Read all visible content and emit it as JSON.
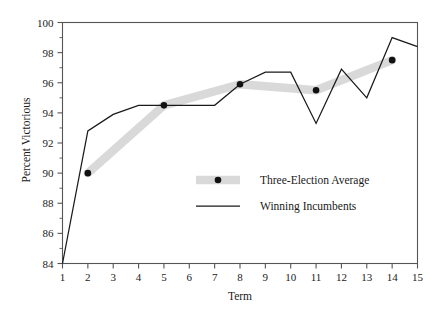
{
  "chart_data": {
    "type": "line",
    "title": "",
    "subtitle": "",
    "xlabel": "Term",
    "ylabel": "Percent Victorious",
    "xlim": [
      1,
      15
    ],
    "ylim": [
      84,
      100
    ],
    "xticks": [
      1,
      2,
      3,
      4,
      5,
      6,
      7,
      8,
      9,
      10,
      11,
      12,
      13,
      14,
      15
    ],
    "yticks": [
      84,
      86,
      88,
      90,
      92,
      94,
      96,
      98,
      100
    ],
    "xtick_labels": [
      "1",
      "2",
      "3",
      "4",
      "5",
      "6",
      "7",
      "8",
      "9",
      "10",
      "11",
      "12",
      "13",
      "14",
      "15"
    ],
    "ytick_labels": [
      "84",
      "86",
      "88",
      "90",
      "92",
      "94",
      "96",
      "98",
      "100"
    ],
    "grid": false,
    "legend_position": "center",
    "series": [
      {
        "name": "Three-Election Average",
        "style": "thick-band-with-markers",
        "color": "#d9d9d9",
        "marker_color": "#111111",
        "x": [
          2,
          5,
          8,
          11,
          14
        ],
        "values": [
          90.0,
          94.5,
          95.9,
          95.5,
          97.5
        ]
      },
      {
        "name": "Winning Incumbents",
        "style": "thin-line",
        "color": "#1a1a1a",
        "x": [
          1,
          2,
          3,
          4,
          5,
          6,
          7,
          8,
          9,
          10,
          11,
          12,
          13,
          14,
          15
        ],
        "values": [
          84.0,
          92.8,
          93.9,
          94.5,
          94.5,
          94.5,
          94.5,
          95.9,
          96.7,
          96.7,
          93.3,
          96.9,
          95.0,
          99.0,
          98.4
        ]
      }
    ]
  },
  "legend": {
    "items": [
      {
        "label": "Three-Election Average",
        "swatch": "band-marker"
      },
      {
        "label": "Winning Incumbents",
        "swatch": "line"
      }
    ]
  },
  "colors": {
    "band": "#d9d9d9",
    "line": "#1a1a1a",
    "marker": "#111111",
    "axis": "#555555",
    "background": "#ffffff"
  }
}
